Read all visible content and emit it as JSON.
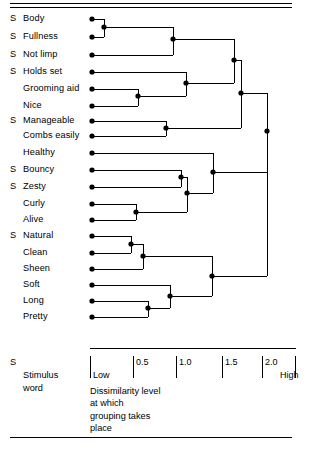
{
  "figure": {
    "title": "",
    "stimulus_marker": "S"
  },
  "legend": {
    "marker": "S",
    "line1": "Stimulus",
    "line2": "word"
  },
  "axis": {
    "label_low": "Low",
    "label_high": "High",
    "ticks": [
      {
        "value": "",
        "x": 90
      },
      {
        "value": "0.5",
        "x": 133
      },
      {
        "value": "1.0",
        "x": 176
      },
      {
        "value": "1.5",
        "x": 222
      },
      {
        "value": "2.0",
        "x": 262
      },
      {
        "value": "",
        "x": 295
      }
    ],
    "caption_lines": [
      "Dissimilarity level",
      "at which",
      "grouping takes",
      "place"
    ]
  },
  "chart_data": {
    "type": "dendrogram",
    "title": "",
    "xlabel": "Dissimilarity level at which grouping takes place",
    "ylabel": "",
    "xlim": [
      0,
      2.4
    ],
    "grid": false,
    "legend_position": "bottom-left",
    "axis_pixel_mapping": {
      "x0_px": 90,
      "px_per_unit": 86.5
    },
    "leaves": [
      {
        "label": "Body",
        "stimulus": true,
        "y": 19,
        "x_px": 92
      },
      {
        "label": "Fullness",
        "stimulus": true,
        "y": 37,
        "x_px": 92
      },
      {
        "label": "Not limp",
        "stimulus": true,
        "y": 55,
        "x_px": 92
      },
      {
        "label": "Holds set",
        "stimulus": true,
        "y": 72,
        "x_px": 92
      },
      {
        "label": "Grooming aid",
        "stimulus": false,
        "y": 89,
        "x_px": 92
      },
      {
        "label": "Nice",
        "stimulus": false,
        "y": 106,
        "x_px": 92
      },
      {
        "label": "Manageable",
        "stimulus": true,
        "y": 121,
        "x_px": 92
      },
      {
        "label": "Combs easily",
        "stimulus": false,
        "y": 136,
        "x_px": 92
      },
      {
        "label": "Healthy",
        "stimulus": false,
        "y": 153,
        "x_px": 92
      },
      {
        "label": "Bouncy",
        "stimulus": true,
        "y": 170,
        "x_px": 92
      },
      {
        "label": "Zesty",
        "stimulus": true,
        "y": 187,
        "x_px": 92
      },
      {
        "label": "Curly",
        "stimulus": false,
        "y": 204,
        "x_px": 92
      },
      {
        "label": "Alive",
        "stimulus": false,
        "y": 220,
        "x_px": 92
      },
      {
        "label": "Natural",
        "stimulus": true,
        "y": 236,
        "x_px": 92
      },
      {
        "label": "Clean",
        "stimulus": false,
        "y": 253,
        "x_px": 92
      },
      {
        "label": "Sheen",
        "stimulus": false,
        "y": 269,
        "x_px": 92
      },
      {
        "label": "Soft",
        "stimulus": false,
        "y": 285,
        "x_px": 92
      },
      {
        "label": "Long",
        "stimulus": false,
        "y": 301,
        "x_px": 92
      },
      {
        "label": "Pretty",
        "stimulus": false,
        "y": 317,
        "x_px": 92
      }
    ],
    "merges": [
      {
        "id": "m1",
        "children": [
          "Body",
          "Fullness"
        ],
        "x_px": 104,
        "y": 27,
        "dissimilarity": 0.14
      },
      {
        "id": "m2",
        "children": [
          "m1",
          "Not limp"
        ],
        "x_px": 173,
        "y": 39,
        "dissimilarity": 0.96
      },
      {
        "id": "m3",
        "children": [
          "Grooming aid",
          "Nice"
        ],
        "x_px": 138,
        "y": 96,
        "dissimilarity": 0.55
      },
      {
        "id": "m4",
        "children": [
          "Holds set",
          "m3"
        ],
        "x_px": 186,
        "y": 83,
        "dissimilarity": 1.11
      },
      {
        "id": "m5",
        "children": [
          "m2",
          "m4"
        ],
        "x_px": 234,
        "y": 60,
        "dissimilarity": 1.66
      },
      {
        "id": "m6",
        "children": [
          "Manageable",
          "Combs easily"
        ],
        "x_px": 166,
        "y": 128,
        "dissimilarity": 0.88
      },
      {
        "id": "m7",
        "children": [
          "m5",
          "m6"
        ],
        "x_px": 241,
        "y": 93,
        "dissimilarity": 1.75
      },
      {
        "id": "m8",
        "children": [
          "Bouncy",
          "Zesty"
        ],
        "x_px": 181,
        "y": 177,
        "dissimilarity": 1.05
      },
      {
        "id": "m9",
        "children": [
          "Curly",
          "Alive"
        ],
        "x_px": 136,
        "y": 212,
        "dissimilarity": 0.53
      },
      {
        "id": "m10",
        "children": [
          "m8",
          "m9"
        ],
        "x_px": 187,
        "y": 193,
        "dissimilarity": 1.12
      },
      {
        "id": "m11",
        "children": [
          "Healthy",
          "m10"
        ],
        "x_px": 213,
        "y": 172,
        "dissimilarity": 1.42
      },
      {
        "id": "m12",
        "children": [
          "Natural",
          "Clean"
        ],
        "x_px": 131,
        "y": 244,
        "dissimilarity": 0.47
      },
      {
        "id": "m13",
        "children": [
          "m12",
          "Sheen"
        ],
        "x_px": 143,
        "y": 256,
        "dissimilarity": 0.61
      },
      {
        "id": "m14",
        "children": [
          "Long",
          "Pretty"
        ],
        "x_px": 148,
        "y": 308,
        "dissimilarity": 0.67
      },
      {
        "id": "m15",
        "children": [
          "Soft",
          "m14"
        ],
        "x_px": 170,
        "y": 296,
        "dissimilarity": 0.92
      },
      {
        "id": "m16",
        "children": [
          "m13",
          "m15"
        ],
        "x_px": 212,
        "y": 276,
        "dissimilarity": 1.41
      },
      {
        "id": "m17",
        "children": [
          "m11",
          "m16"
        ],
        "x_px": 267,
        "y": 131,
        "dissimilarity": 2.05
      }
    ],
    "root": "m7_m17",
    "root_link": {
      "from": "m7",
      "to": "m17",
      "x_px": 267
    }
  }
}
